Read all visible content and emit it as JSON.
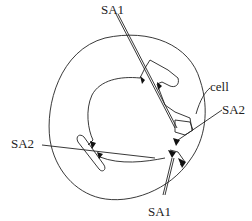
{
  "diagram": {
    "labels": {
      "sa1_top": "SA1",
      "sa1_bottom": "SA1",
      "sa2_left": "SA2",
      "sa2_right": "SA2",
      "cell": "cell"
    },
    "colors": {
      "stroke": "#222222",
      "fill_dark": "#111111",
      "background": "#ffffff"
    }
  }
}
